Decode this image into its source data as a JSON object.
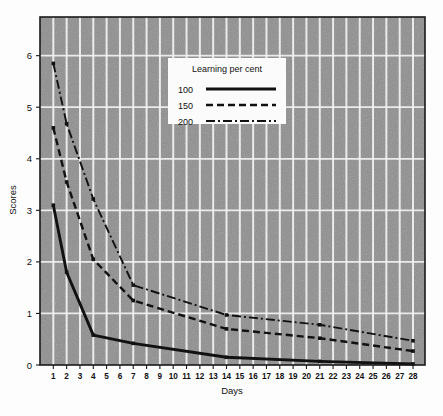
{
  "chart_data": {
    "type": "line",
    "title": "",
    "xlabel": "Days",
    "ylabel": "Scores",
    "xlim": [
      0,
      28.9
    ],
    "ylim": [
      0,
      6.75
    ],
    "grid": true,
    "xticks": [
      1,
      2,
      3,
      4,
      5,
      6,
      7,
      8,
      9,
      10,
      11,
      12,
      13,
      14,
      15,
      16,
      17,
      18,
      19,
      20,
      21,
      22,
      23,
      24,
      25,
      26,
      27,
      28
    ],
    "xticklabels": [
      "1",
      "2",
      "3",
      "4",
      "5",
      "6",
      "7",
      "8",
      "9",
      "10",
      "11",
      "12",
      "13",
      "14",
      "15",
      "16",
      "17",
      "18",
      "19",
      "20",
      "21",
      "22",
      "23",
      "24",
      "25",
      "26",
      "27",
      "28"
    ],
    "yticks": [
      0,
      1,
      2,
      3,
      4,
      5,
      6
    ],
    "yticklabels": [
      "0",
      "1",
      "2",
      "3",
      "4",
      "5",
      "6"
    ],
    "legend": {
      "title": "Learning per cent",
      "position": "upper-center",
      "entries": [
        {
          "label": "100",
          "style": "solid"
        },
        {
          "label": "150",
          "style": "dashed"
        },
        {
          "label": "200",
          "style": "dash-dot"
        }
      ]
    },
    "series": [
      {
        "name": "100",
        "style": "solid",
        "x": [
          1,
          2,
          4,
          7,
          14,
          21,
          28
        ],
        "values": [
          3.1,
          1.8,
          0.58,
          0.42,
          0.15,
          0.07,
          0.02
        ]
      },
      {
        "name": "150",
        "style": "dashed",
        "x": [
          1,
          2,
          4,
          7,
          14,
          21,
          28
        ],
        "values": [
          4.6,
          3.55,
          2.05,
          1.25,
          0.7,
          0.52,
          0.27
        ]
      },
      {
        "name": "200",
        "style": "dash-dot",
        "x": [
          1,
          2,
          4,
          7,
          14,
          21,
          28
        ],
        "values": [
          5.85,
          4.68,
          3.22,
          1.55,
          0.97,
          0.78,
          0.47
        ]
      }
    ],
    "colors": {
      "plot_background": "#8f8f8f",
      "grid": "#f2f2f2",
      "line": "#111111",
      "frame": "#1a1a1a",
      "legend_background": "#fbfbfb"
    }
  }
}
